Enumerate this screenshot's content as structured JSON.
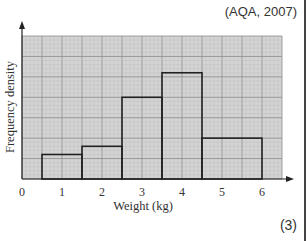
{
  "source_text": "(AQA, 2007)",
  "marks_text": "(3)",
  "chart_data": {
    "type": "bar",
    "subtype": "histogram",
    "title": "",
    "xlabel": "Weight (kg)",
    "ylabel": "Frequency density",
    "x_ticks": [
      "0",
      "1",
      "2",
      "3",
      "4",
      "5",
      "6"
    ],
    "y_ticks": [],
    "xlim": [
      0,
      6.5
    ],
    "ylim_major_units": [
      0,
      7
    ],
    "grid": true,
    "bins": [
      {
        "from": 0.5,
        "to": 1.5,
        "height_major_units": 1.2
      },
      {
        "from": 1.5,
        "to": 2.5,
        "height_major_units": 1.6
      },
      {
        "from": 2.5,
        "to": 3.5,
        "height_major_units": 4.0
      },
      {
        "from": 3.5,
        "to": 4.5,
        "height_major_units": 5.2
      },
      {
        "from": 4.5,
        "to": 6.0,
        "height_major_units": 2.0
      }
    ],
    "categories": [
      "0.5-1.5",
      "1.5-2.5",
      "2.5-3.5",
      "3.5-4.5",
      "4.5-6"
    ],
    "values": [
      1.2,
      1.6,
      4.0,
      5.2,
      2.0
    ],
    "legend": null
  },
  "colors": {
    "grid_bg": "#d4d4d4",
    "grid_major": "#8a8a8a",
    "grid_minor": "#bcbcbc",
    "bar_outline": "#222222"
  }
}
